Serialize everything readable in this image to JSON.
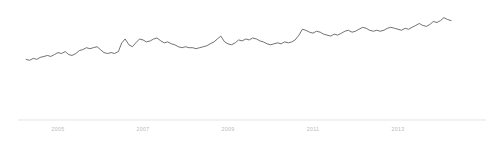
{
  "chart_data": {
    "type": "line",
    "title": "",
    "subtitle": "",
    "xlabel": "",
    "ylabel": "",
    "grid": false,
    "legend": false,
    "legend_position": "none",
    "axis_color": "#d9d9d9",
    "line_color": "#595959",
    "background_color": "#ffffff",
    "x_tick_labels": [
      "2005",
      "2007",
      "2009",
      "2011",
      "2013"
    ],
    "x_tick_positions_px": [
      58,
      143,
      228,
      313,
      398
    ],
    "xlim": [
      "2004.2",
      "2014.3"
    ],
    "ylim": [
      0,
      100
    ],
    "series": [
      {
        "name": "series-1",
        "x": [
          2004.25,
          2004.33,
          2004.42,
          2004.5,
          2004.58,
          2004.67,
          2004.75,
          2004.83,
          2004.92,
          2005.0,
          2005.08,
          2005.17,
          2005.25,
          2005.33,
          2005.42,
          2005.5,
          2005.58,
          2005.67,
          2005.75,
          2005.83,
          2005.92,
          2006.0,
          2006.08,
          2006.17,
          2006.25,
          2006.33,
          2006.42,
          2006.5,
          2006.58,
          2006.67,
          2006.75,
          2006.83,
          2006.92,
          2007.0,
          2007.08,
          2007.17,
          2007.25,
          2007.33,
          2007.42,
          2007.5,
          2007.58,
          2007.67,
          2007.75,
          2007.83,
          2007.92,
          2008.0,
          2008.08,
          2008.17,
          2008.25,
          2008.33,
          2008.42,
          2008.5,
          2008.58,
          2008.67,
          2008.75,
          2008.83,
          2008.92,
          2009.0,
          2009.08,
          2009.17,
          2009.25,
          2009.33,
          2009.42,
          2009.5,
          2009.58,
          2009.67,
          2009.75,
          2009.83,
          2009.92,
          2010.0,
          2010.08,
          2010.17,
          2010.25,
          2010.33,
          2010.42,
          2010.5,
          2010.58,
          2010.67,
          2010.75,
          2010.83,
          2010.92,
          2011.0,
          2011.08,
          2011.17,
          2011.25,
          2011.33,
          2011.42,
          2011.5,
          2011.58,
          2011.67,
          2011.75,
          2011.83,
          2011.92,
          2012.0,
          2012.08,
          2012.17,
          2012.25,
          2012.33,
          2012.42,
          2012.5,
          2012.58,
          2012.67,
          2012.75,
          2012.83,
          2012.92,
          2013.0,
          2013.08,
          2013.17,
          2013.25,
          2013.33,
          2013.42,
          2013.5,
          2013.58,
          2013.67,
          2013.75,
          2013.83,
          2013.92,
          2014.0,
          2014.08,
          2014.17,
          2014.25
        ],
        "values": [
          45,
          44,
          46,
          45,
          47,
          48,
          49,
          48,
          50,
          52,
          51,
          53,
          50,
          49,
          51,
          54,
          55,
          57,
          56,
          57,
          58,
          55,
          52,
          51,
          52,
          51,
          53,
          62,
          66,
          60,
          58,
          62,
          66,
          65,
          63,
          64,
          66,
          67,
          64,
          62,
          63,
          61,
          60,
          58,
          57,
          58,
          57,
          57,
          56,
          57,
          58,
          59,
          61,
          63,
          66,
          69,
          63,
          61,
          60,
          62,
          65,
          64,
          66,
          65,
          67,
          66,
          64,
          63,
          61,
          60,
          61,
          62,
          61,
          63,
          62,
          63,
          65,
          70,
          76,
          75,
          73,
          72,
          74,
          73,
          71,
          70,
          69,
          71,
          70,
          72,
          74,
          75,
          73,
          74,
          76,
          78,
          77,
          75,
          74,
          75,
          74,
          75,
          77,
          78,
          77,
          76,
          75,
          77,
          76,
          78,
          80,
          82,
          80,
          79,
          81,
          84,
          83,
          85,
          88,
          86,
          85
        ]
      }
    ]
  },
  "axis": {
    "line_start_px": 18,
    "line_end_px": 486,
    "line_y_px": 120
  }
}
